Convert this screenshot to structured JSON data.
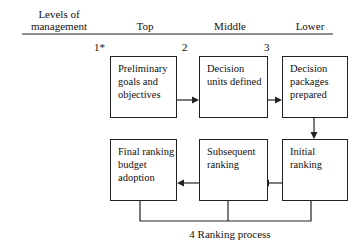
{
  "header": {
    "levels_label_line1": "Levels of",
    "levels_label_line2": "management",
    "columns": [
      "Top",
      "Middle",
      "Lower"
    ]
  },
  "step_numbers": [
    "1*",
    "2",
    "3"
  ],
  "boxes": {
    "preliminary": "Preliminary goals and objectives",
    "decision_units": "Decision units defined",
    "decision_packages": "Decision packages prepared",
    "initial_ranking": "Initial ranking",
    "subsequent_ranking": "Subsequent ranking",
    "final_ranking": "Final ranking budget adoption"
  },
  "caption": "4 Ranking process"
}
